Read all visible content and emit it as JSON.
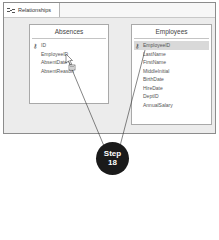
{
  "window": {
    "tab_label": "Relationships",
    "tab_icon": "relationships-icon"
  },
  "tables": [
    {
      "title": "Absences",
      "fields": [
        {
          "name": "ID",
          "primary_key": true
        },
        {
          "name": "EmployeeID",
          "primary_key": false
        },
        {
          "name": "AbsentDate",
          "primary_key": false
        },
        {
          "name": "AbsentReason",
          "primary_key": false
        }
      ]
    },
    {
      "title": "Employees",
      "fields": [
        {
          "name": "EmployeeID",
          "primary_key": true,
          "selected": true
        },
        {
          "name": "LastName",
          "primary_key": false
        },
        {
          "name": "FirstName",
          "primary_key": false
        },
        {
          "name": "MiddleInitial",
          "primary_key": false
        },
        {
          "name": "BirthDate",
          "primary_key": false
        },
        {
          "name": "HireDate",
          "primary_key": false
        },
        {
          "name": "DeptID",
          "primary_key": false
        },
        {
          "name": "AnnualSalary",
          "primary_key": false
        }
      ]
    }
  ],
  "callout": {
    "line1": "Step",
    "line2": "18"
  },
  "colors": {
    "window_bg": "#ececec",
    "callout_bg": "#1a1a1a",
    "selected_row": "#d9d9d9"
  }
}
